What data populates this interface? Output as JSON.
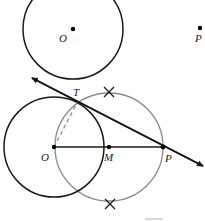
{
  "diagram": {
    "top_figure": {
      "center_label": "O",
      "point_label": "P"
    },
    "bottom_figure": {
      "center_label": "O",
      "midpoint_label": "M",
      "external_point_label": "P",
      "tangent_point_label": "T"
    },
    "colors": {
      "circle": "#1a1a1a",
      "construction_circle": "#8a8a8a",
      "line": "#1a1a1a"
    }
  }
}
